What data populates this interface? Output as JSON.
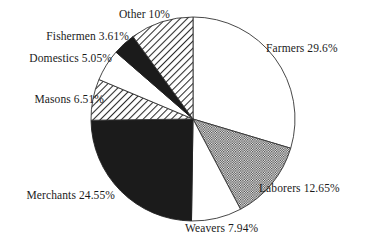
{
  "chart_data": {
    "type": "pie",
    "title": "",
    "subtitle": "",
    "xlabel": "",
    "ylabel": "",
    "legend_position": "none",
    "grid": false,
    "value_unit": "percent",
    "start_angle_deg": 0,
    "direction": "clockwise",
    "categories": [
      "Farmers",
      "Laborers",
      "Weavers",
      "Merchants",
      "Masons",
      "Domestics",
      "Fishermen",
      "Other"
    ],
    "values": [
      29.6,
      12.65,
      7.94,
      24.55,
      6.51,
      5.05,
      3.61,
      10
    ],
    "labels": [
      "Farmers 29.6%",
      "Laborers 12.65%",
      "Weavers 7.94%",
      "Merchants 24.55%",
      "Masons 6.51%",
      "Domestics 5.05%",
      "Fishermen 3.61%",
      "Other 10%"
    ],
    "slices": [
      {
        "name": "Farmers",
        "label": "Farmers 29.6%",
        "value": 29.6,
        "fill": "white",
        "stroke": "#333333"
      },
      {
        "name": "Laborers",
        "label": "Laborers 12.65%",
        "value": 12.65,
        "fill": "dots",
        "stroke": "#333333"
      },
      {
        "name": "Weavers",
        "label": "Weavers 7.94%",
        "value": 7.94,
        "fill": "white",
        "stroke": "#333333"
      },
      {
        "name": "Merchants",
        "label": "Merchants 24.55%",
        "value": 24.55,
        "fill": "black",
        "stroke": "#222222"
      },
      {
        "name": "Masons",
        "label": "Masons 6.51%",
        "value": 6.51,
        "fill": "hatch",
        "stroke": "#333333"
      },
      {
        "name": "Domestics",
        "label": "Domestics 5.05%",
        "value": 5.05,
        "fill": "white",
        "stroke": "#333333"
      },
      {
        "name": "Fishermen",
        "label": "Fishermen 3.61%",
        "value": 3.61,
        "fill": "black",
        "stroke": "#222222"
      },
      {
        "name": "Other",
        "label": "Other 10%",
        "value": 10,
        "fill": "hatch",
        "stroke": "#333333"
      }
    ],
    "colors": {
      "solid_black": "#1b1b1b",
      "white": "#ffffff",
      "outline": "#333333",
      "text": "#1a1a1a",
      "background": "#ffffff"
    }
  }
}
